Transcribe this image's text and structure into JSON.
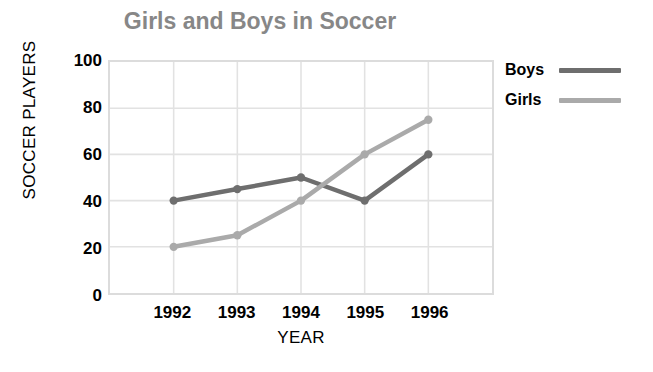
{
  "chart_data": {
    "type": "line",
    "title": "Girls and Boys in Soccer",
    "xlabel": "YEAR",
    "ylabel": "SOCCER PLAYERS",
    "categories": [
      "1992",
      "1993",
      "1994",
      "1995",
      "1996"
    ],
    "series": [
      {
        "name": "Boys",
        "values": [
          40,
          45,
          50,
          40,
          60
        ],
        "color": "#6e6e6e"
      },
      {
        "name": "Girls",
        "values": [
          20,
          25,
          40,
          60,
          75
        ],
        "color": "#aaaaaa"
      }
    ],
    "ylim": [
      0,
      100
    ],
    "yticks": [
      0,
      20,
      40,
      60,
      80,
      100
    ],
    "ytick_labels": [
      "0",
      "20",
      "40",
      "60",
      "80",
      "100"
    ],
    "grid": true,
    "grid_color": "#e2e2e2",
    "legend_position": "right-top",
    "title_color": "#878787",
    "plot_border_color": "#dcdcdc",
    "background": "#ffffff",
    "marker": "circle"
  },
  "legend": {
    "entries": [
      {
        "label": "Boys",
        "color": "#6e6e6e"
      },
      {
        "label": "Girls",
        "color": "#aaaaaa"
      }
    ]
  }
}
